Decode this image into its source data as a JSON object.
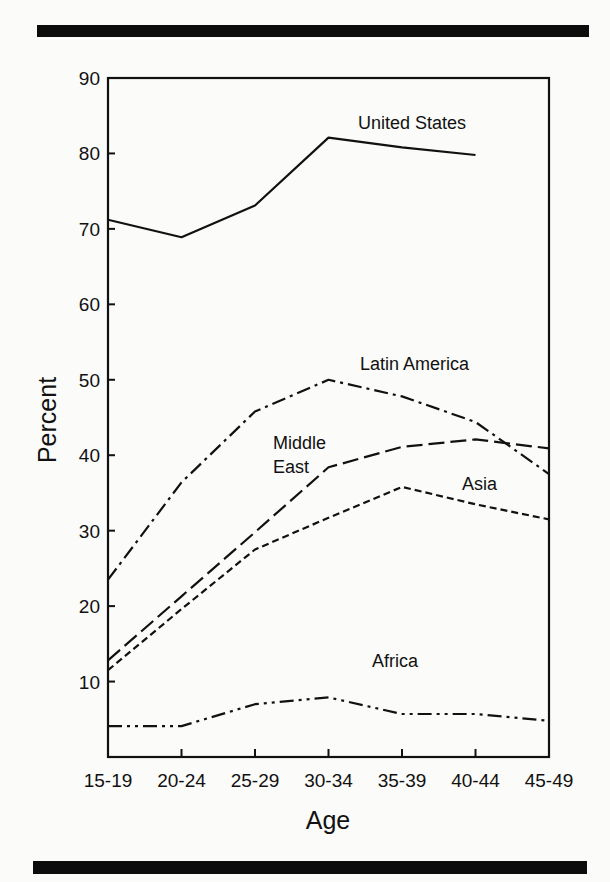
{
  "chart_data": {
    "type": "line",
    "title": "",
    "xlabel": "Age",
    "ylabel": "Percent",
    "ylim": [
      0,
      90
    ],
    "yticks": [
      10,
      20,
      30,
      40,
      50,
      60,
      70,
      80,
      90
    ],
    "ytick_labels": [
      "10",
      "20",
      "30",
      "40",
      "50",
      "60",
      "70",
      "80",
      "90"
    ],
    "categories": [
      "15-19",
      "20-24",
      "25-29",
      "30-34",
      "35-39",
      "40-44",
      "45-49"
    ],
    "grid": false,
    "legend_position": "inline labels",
    "series": [
      {
        "name": "United States",
        "line_style": "solid",
        "values": [
          71.2,
          68.9,
          73.1,
          82.1,
          80.8,
          79.8,
          null
        ]
      },
      {
        "name": "Latin America",
        "line_style": "dash-dot",
        "values": [
          23.5,
          36.4,
          45.8,
          50.0,
          47.8,
          44.4,
          37.5
        ]
      },
      {
        "name": "Middle East",
        "line_style": "long-dash",
        "values": [
          12.8,
          21.3,
          29.8,
          38.4,
          41.1,
          42.1,
          40.9
        ]
      },
      {
        "name": "Asia",
        "line_style": "short-dash",
        "values": [
          11.5,
          19.6,
          27.5,
          31.7,
          35.8,
          33.5,
          31.5
        ]
      },
      {
        "name": "Africa",
        "line_style": "dash-dot-dot",
        "values": [
          4.1,
          4.1,
          7.0,
          7.9,
          5.7,
          5.7,
          4.8
        ]
      }
    ],
    "annotations": [
      {
        "text": "United States",
        "series": "United States",
        "x": 358,
        "y": 129
      },
      {
        "text": "Latin America",
        "series": "Latin America",
        "x": 360,
        "y": 370
      },
      {
        "text": "Middle",
        "series": "Middle East",
        "x": 273,
        "y": 449
      },
      {
        "text": "East",
        "series": "Middle East",
        "x": 273,
        "y": 473
      },
      {
        "text": "Asia",
        "series": "Asia",
        "x": 462,
        "y": 490
      },
      {
        "text": "Africa",
        "series": "Africa",
        "x": 372,
        "y": 667
      }
    ]
  },
  "colors": {
    "line": "#111111",
    "background": "#fbfbfa",
    "rule": "#0c0c0c"
  }
}
